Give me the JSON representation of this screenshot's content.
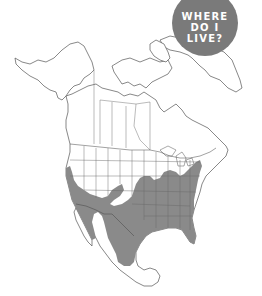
{
  "badge": {
    "lines": [
      "WHERE",
      "DO I",
      "LIVE?"
    ],
    "color": "#7a7a7a",
    "text_color": "#ffffff"
  },
  "map": {
    "region": "North America",
    "range_fill_color": "#8a8a8a",
    "outline_color": "#555555"
  }
}
